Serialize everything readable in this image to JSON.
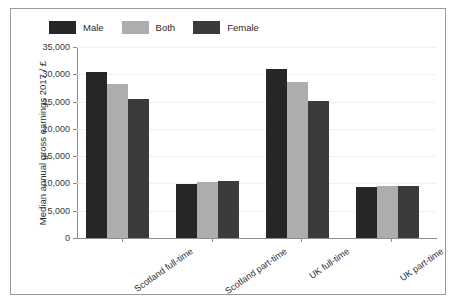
{
  "chart_data": {
    "type": "bar",
    "title": "",
    "xlabel": "",
    "ylabel": "Median annual gross earnings 2017 / £",
    "categories": [
      "Scotland full-time",
      "Scotland part-time",
      "UK full-time",
      "UK part-time"
    ],
    "series": [
      {
        "name": "Male",
        "color": "#262626",
        "values": [
          30400,
          9900,
          31000,
          9300
        ]
      },
      {
        "name": "Both",
        "color": "#adadad",
        "values": [
          28300,
          10300,
          28500,
          9600
        ]
      },
      {
        "name": "Female",
        "color": "#3b3b3b",
        "values": [
          25500,
          10400,
          25100,
          9600
        ]
      }
    ],
    "ylim": [
      0,
      35000
    ],
    "yticks": [
      0,
      5000,
      10000,
      15000,
      20000,
      25000,
      30000,
      35000
    ],
    "ytick_labels": [
      "0",
      "5,000",
      "10,000",
      "15,000",
      "20,000",
      "25,000",
      "30,000",
      "35,000"
    ],
    "grid": true,
    "legend_position": "top-left",
    "legend_entries": [
      "Male",
      "Both",
      "Female"
    ]
  },
  "figure": {
    "border_color": "#9a9a9a",
    "background": "#ffffff",
    "axis_color": "#8d8d8d"
  }
}
